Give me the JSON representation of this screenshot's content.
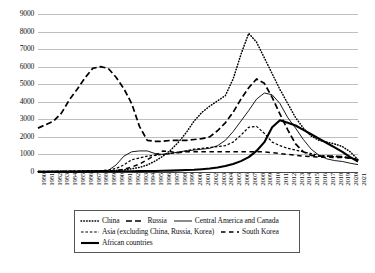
{
  "chart_data": {
    "type": "line",
    "title": "",
    "xlabel": "",
    "ylabel": "",
    "ylim": [
      0,
      9000
    ],
    "ytick_step": 1000,
    "grid": true,
    "legend_position": "bottom",
    "yticks": [
      "0",
      "1000",
      "2000",
      "3000",
      "4000",
      "5000",
      "6000",
      "7000",
      "8000",
      "9000"
    ],
    "x": [
      "1980",
      "1981",
      "1982",
      "1983",
      "1984",
      "1985",
      "1986",
      "1987",
      "1988",
      "1989",
      "1990",
      "1991",
      "1992",
      "1993",
      "1994",
      "1995",
      "1996",
      "1997",
      "1998",
      "1999",
      "2000",
      "2001",
      "2002",
      "2003",
      "2004",
      "2005",
      "2006",
      "2007",
      "2008",
      "2009",
      "2010",
      "2011",
      "2012",
      "2013",
      "2014",
      "2015",
      "2016",
      "2017",
      "2018",
      "2019",
      "2020",
      "2021"
    ],
    "series": [
      {
        "name": "China",
        "style": "dotted",
        "values": [
          20,
          20,
          25,
          30,
          30,
          35,
          40,
          45,
          55,
          70,
          90,
          120,
          180,
          260,
          400,
          620,
          900,
          1250,
          1700,
          2250,
          2900,
          3400,
          3750,
          4050,
          4350,
          5300,
          6700,
          7900,
          7400,
          6500,
          5600,
          4700,
          3900,
          3100,
          2500,
          2050,
          1800,
          1700,
          1600,
          1450,
          1150,
          700
        ]
      },
      {
        "name": "Russia",
        "style": "long-dash",
        "values": [
          2500,
          2700,
          2900,
          3350,
          4100,
          4700,
          5350,
          5900,
          6000,
          5900,
          5400,
          4750,
          3900,
          2600,
          1800,
          1750,
          1750,
          1800,
          1800,
          1800,
          1850,
          1900,
          2000,
          2350,
          2800,
          3400,
          4150,
          4800,
          5300,
          5050,
          4250,
          3300,
          2400,
          1600,
          1150,
          950,
          900,
          900,
          900,
          880,
          800,
          700
        ]
      },
      {
        "name": "Central America and Canada",
        "style": "thin-solid",
        "values": [
          40,
          40,
          45,
          50,
          50,
          55,
          60,
          65,
          70,
          90,
          400,
          900,
          1150,
          1200,
          1200,
          1050,
          1000,
          1050,
          1150,
          1200,
          1250,
          1300,
          1350,
          1500,
          1800,
          2300,
          2900,
          3500,
          4150,
          4500,
          4400,
          3900,
          3100,
          2500,
          1850,
          1300,
          950,
          750,
          650,
          600,
          500,
          420
        ]
      },
      {
        "name": "Asia (excluding China, Russia, Korea)",
        "style": "short-dash",
        "values": [
          30,
          30,
          35,
          40,
          45,
          50,
          60,
          70,
          80,
          110,
          200,
          400,
          700,
          800,
          900,
          950,
          1000,
          1050,
          1100,
          1200,
          1300,
          1350,
          1400,
          1450,
          1500,
          1700,
          2100,
          2550,
          2600,
          2200,
          1700,
          1500,
          1350,
          1250,
          1150,
          1050,
          950,
          900,
          880,
          850,
          800,
          700
        ]
      },
      {
        "name": "South Korea",
        "style": "medium-dash",
        "values": [
          20,
          20,
          20,
          25,
          25,
          30,
          35,
          40,
          45,
          55,
          80,
          150,
          280,
          450,
          700,
          950,
          1200,
          1150,
          1100,
          1150,
          1150,
          1150,
          1150,
          1150,
          1150,
          1150,
          1150,
          1150,
          1150,
          1150,
          1100,
          1050,
          1000,
          950,
          900,
          880,
          850,
          840,
          830,
          820,
          780,
          700
        ]
      },
      {
        "name": "African countries",
        "style": "thick-solid",
        "values": [
          10,
          10,
          12,
          14,
          16,
          18,
          20,
          22,
          25,
          30,
          35,
          40,
          45,
          50,
          55,
          60,
          70,
          80,
          95,
          110,
          130,
          160,
          200,
          260,
          340,
          450,
          620,
          850,
          1200,
          1700,
          2550,
          2950,
          2800,
          2650,
          2400,
          2150,
          1900,
          1650,
          1400,
          1150,
          850,
          600
        ]
      }
    ],
    "legend": [
      {
        "label": "China",
        "style": "dotted"
      },
      {
        "label": "Russia",
        "style": "long-dash"
      },
      {
        "label": "Central America and Canada",
        "style": "thin-solid"
      },
      {
        "label": "Asia (excluding China, Russia, Korea)",
        "style": "short-dash"
      },
      {
        "label": "South Korea",
        "style": "medium-dash"
      },
      {
        "label": "African countries",
        "style": "thick-solid"
      }
    ],
    "colors": {
      "ink": "#000000",
      "grid": "#bfbfbf",
      "axis": "#444444"
    }
  }
}
